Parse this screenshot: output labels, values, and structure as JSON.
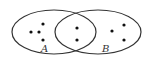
{
  "diagram": {
    "type": "venn",
    "sets": [
      {
        "label": "A",
        "dots_only": 4
      },
      {
        "label": "B",
        "dots_only": 3
      }
    ],
    "intersection_dots": 2,
    "colors": {
      "stroke": "#333333",
      "background": "#ffffff"
    }
  }
}
